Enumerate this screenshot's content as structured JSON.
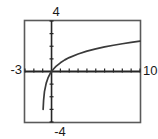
{
  "chart_data": {
    "type": "line",
    "title": "",
    "subtitle": "",
    "xlabel": "",
    "ylabel": "",
    "grid": false,
    "legend": null,
    "xlim": [
      -3,
      10
    ],
    "ylim": [
      -4,
      4
    ],
    "xtick_label_min": "-3",
    "xtick_label_max": "10",
    "ytick_label_min": "-4",
    "ytick_label_max": "4",
    "x_tick_spacing": 1,
    "y_tick_spacing": 1,
    "axes_style": "graphing-calculator-window",
    "series": [
      {
        "name": "curve",
        "shape": "logarithmic-increasing",
        "x": [
          -0.95,
          -0.9,
          -0.8,
          -0.6,
          -0.4,
          -0.2,
          0.0,
          0.25,
          0.5,
          1.0,
          1.5,
          2.0,
          3.0,
          4.0,
          5.0,
          6.0,
          7.0,
          8.0,
          9.0,
          10.0
        ],
        "y": [
          -3.0,
          -2.3,
          -1.6,
          -0.92,
          -0.51,
          -0.22,
          0.0,
          0.22,
          0.41,
          0.69,
          0.92,
          1.1,
          1.39,
          1.61,
          1.79,
          1.95,
          2.08,
          2.2,
          2.3,
          2.4
        ]
      }
    ],
    "x_axis_crossing": 0,
    "y_axis_crossing": 0,
    "root_x": -1.0,
    "colors": {
      "curve": "#3a3a3a",
      "axis": "#2b2b2b",
      "frame": "#555555",
      "label": "#1a1a1a",
      "background": "#ffffff"
    }
  },
  "labels": {
    "top": "4",
    "left": "-3",
    "right": "10",
    "bottom": "-4"
  }
}
